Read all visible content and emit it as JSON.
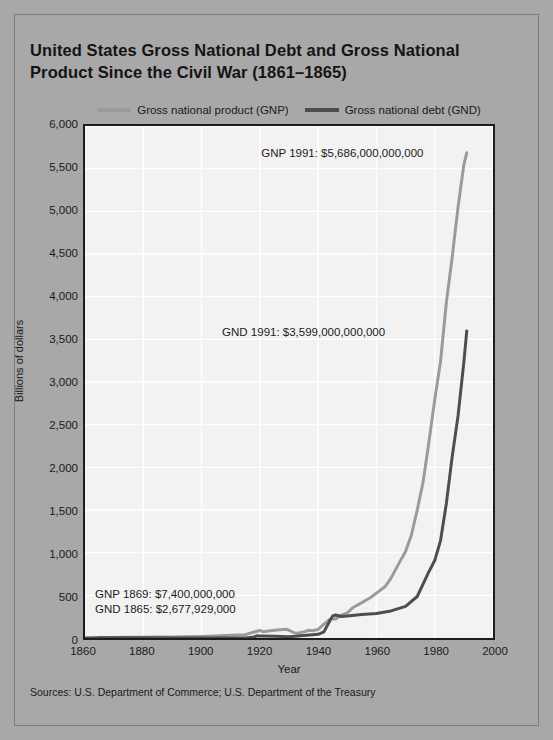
{
  "title": "United States Gross National Debt and Gross National Product Since the Civil War (1861–1865)",
  "legend": {
    "gnp_label": "Gross national product (GNP)",
    "gnd_label": "Gross national debt (GND)"
  },
  "axes": {
    "y_title": "Billions of dollars",
    "x_title": "Year"
  },
  "annotations": {
    "gnp_1991": "GNP 1991: $5,686,000,000,000",
    "gnd_1991": "GND 1991: $3,599,000,000,000",
    "gnp_1869": "GNP 1869: $7,400,000,000",
    "gnd_1865": "GND 1865: $2,677,929,000"
  },
  "source_note": "Sources: U.S. Department of Commerce; U.S. Department of the Treasury",
  "colors": {
    "page_background": "#a8a8a8",
    "plot_background": "#f2f2f2",
    "gridline": "#ffffff",
    "axis_border": "#1c1c1c",
    "gnp_line": "#9a9a9a",
    "gnd_line": "#4d4d4d",
    "text": "#1a1a1a"
  },
  "chart_data": {
    "type": "line",
    "title": "United States Gross National Debt and Gross National Product Since the Civil War (1861–1865)",
    "xlabel": "Year",
    "ylabel": "Billions of dollars",
    "xlim": [
      1860,
      2000
    ],
    "ylim": [
      0,
      6000
    ],
    "xticks": [
      1860,
      1880,
      1900,
      1920,
      1940,
      1960,
      1980,
      2000
    ],
    "yticks": [
      0,
      500,
      1000,
      1500,
      2000,
      2500,
      3000,
      3500,
      4000,
      4500,
      5000,
      5500,
      6000
    ],
    "ytick_labels": [
      "0",
      "500",
      "1,000",
      "1,500",
      "2,000",
      "2,500",
      "3,000",
      "3,500",
      "4,000",
      "4,500",
      "5,000",
      "5,500",
      "6,000"
    ],
    "xtick_labels": [
      "1860",
      "1880",
      "1900",
      "1920",
      "1940",
      "1960",
      "1980",
      "2000"
    ],
    "grid": true,
    "legend_position": "above-plot",
    "series": [
      {
        "name": "Gross national product (GNP)",
        "color": "#9a9a9a",
        "x": [
          1865,
          1869,
          1875,
          1880,
          1885,
          1890,
          1895,
          1900,
          1905,
          1910,
          1915,
          1918,
          1920,
          1921,
          1925,
          1929,
          1930,
          1932,
          1933,
          1935,
          1937,
          1938,
          1940,
          1942,
          1944,
          1945,
          1946,
          1948,
          1950,
          1952,
          1955,
          1958,
          1960,
          1963,
          1965,
          1968,
          1970,
          1972,
          1974,
          1976,
          1978,
          1980,
          1982,
          1984,
          1986,
          1988,
          1990,
          1991
        ],
        "y": [
          6.0,
          7.4,
          8.0,
          9.5,
          11.0,
          13.0,
          14.0,
          18.0,
          24.0,
          31.0,
          39.0,
          70.0,
          88.0,
          74.0,
          91.0,
          103.0,
          91.0,
          58.0,
          56.0,
          72.0,
          91.0,
          85.0,
          100.0,
          162.0,
          219.0,
          223.0,
          222.0,
          269.0,
          293.0,
          358.0,
          415.0,
          474.0,
          526.0,
          603.0,
          702.0,
          892.0,
          1013.0,
          1207.0,
          1500.0,
          1825.0,
          2295.0,
          2790.0,
          3242.0,
          3933.0,
          4463.0,
          5049.0,
          5546.0,
          5686.0
        ]
      },
      {
        "name": "Gross national debt (GND)",
        "color": "#4d4d4d",
        "x": [
          1860,
          1865,
          1870,
          1875,
          1880,
          1890,
          1900,
          1910,
          1915,
          1918,
          1919,
          1920,
          1925,
          1930,
          1932,
          1935,
          1938,
          1940,
          1942,
          1944,
          1945,
          1946,
          1948,
          1950,
          1955,
          1960,
          1965,
          1970,
          1974,
          1976,
          1978,
          1980,
          1982,
          1984,
          1986,
          1988,
          1990,
          1991
        ],
        "y": [
          0.065,
          2.678,
          2.436,
          2.232,
          2.09,
          1.222,
          1.263,
          1.147,
          1.191,
          12.455,
          25.485,
          24.299,
          20.516,
          16.185,
          19.487,
          28.701,
          37.165,
          42.967,
          72.422,
          201.003,
          258.682,
          269.422,
          252.292,
          257.357,
          274.366,
          286.331,
          317.274,
          370.919,
          486.247,
          631.866,
          776.602,
          907.701,
          1142.0,
          1577.0,
          2125.0,
          2602.0,
          3233.0,
          3599.0
        ]
      }
    ],
    "annotations": [
      {
        "text": "GNP 1991: $5,686,000,000,000",
        "x": 1975,
        "y": 5686
      },
      {
        "text": "GND 1991: $3,599,000,000,000",
        "x": 1962,
        "y": 3599
      },
      {
        "text": "GNP 1869: $7,400,000,000",
        "x": 1872,
        "y": 560
      },
      {
        "text": "GND 1865: $2,677,929,000",
        "x": 1871,
        "y": 380
      }
    ],
    "source": "Sources: U.S. Department of Commerce; U.S. Department of the Treasury"
  }
}
